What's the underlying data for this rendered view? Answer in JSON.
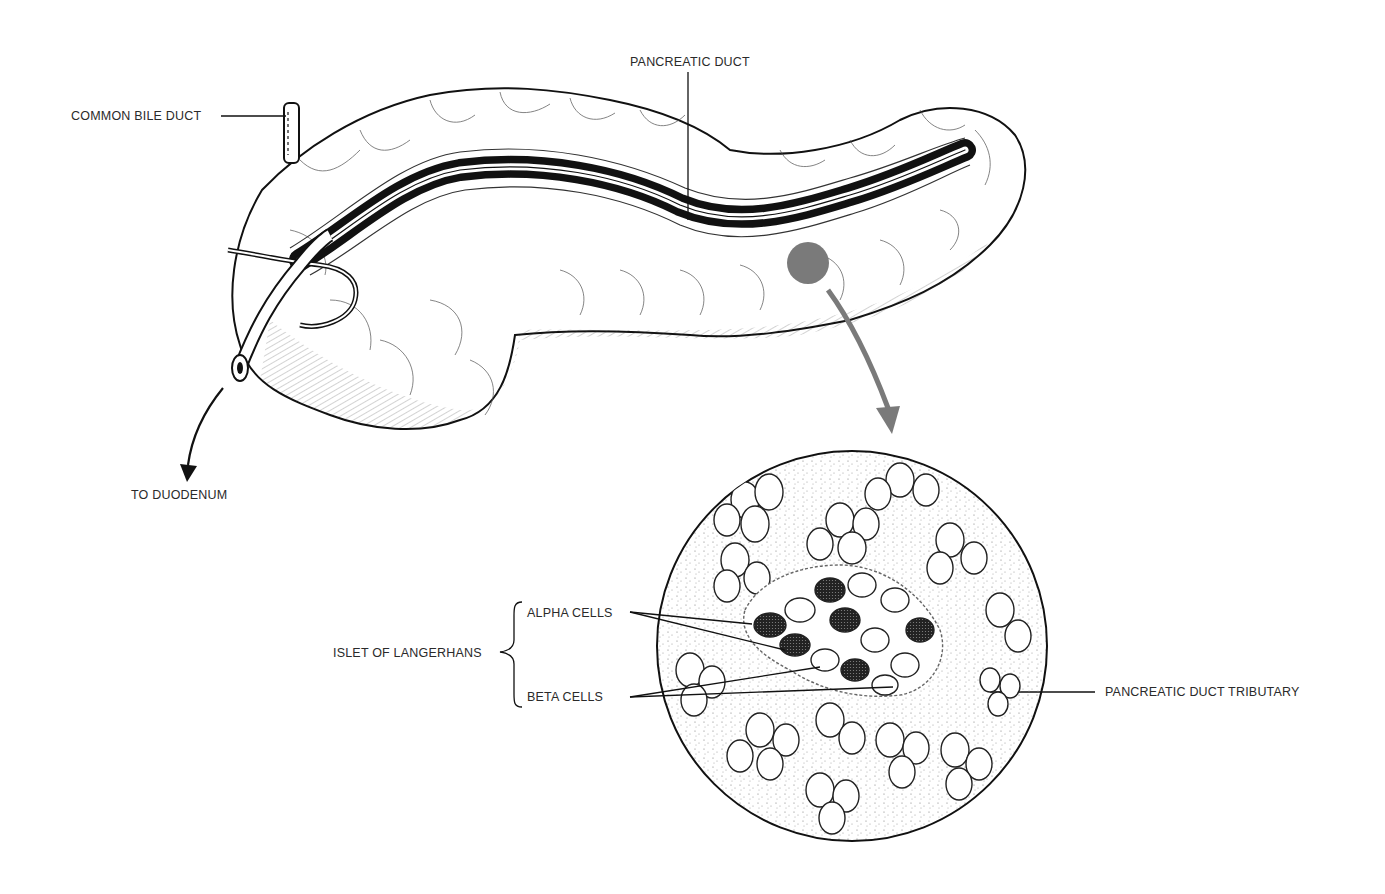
{
  "diagram": {
    "labels": {
      "pancreatic_duct": "PANCREATIC DUCT",
      "common_bile_duct": "COMMON BILE DUCT",
      "to_duodenum": "TO DUODENUM",
      "islet_of_langerhans": "ISLET OF LANGERHANS",
      "alpha_cells": "ALPHA CELLS",
      "beta_cells": "BETA CELLS",
      "pancreatic_duct_tributary": "PANCREATIC DUCT TRIBUTARY"
    },
    "colors": {
      "ink": "#1a1a1a",
      "highlight_spot": "#7a7a7a",
      "magnify_arrow": "#7a7a7a",
      "background": "#ffffff"
    }
  }
}
